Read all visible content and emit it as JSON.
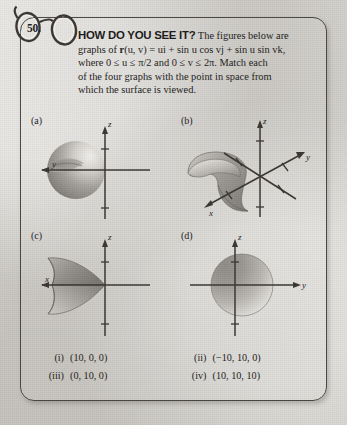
{
  "exercise": {
    "number": "50.",
    "icon": "eyeglasses-icon",
    "heading": "HOW DO YOU SEE IT?",
    "body_line1": "The figures below are",
    "body_line2_pre": "graphs of ",
    "body_line2_r": "r",
    "body_line2_args": "(u, v)",
    "body_line2_eq": " = ",
    "body_line2_terms": "ui + sin u cos vj + sin u sin vk,",
    "body_line3": "where 0 ≤ u ≤ π/2 and 0 ≤ v ≤ 2π. Match each",
    "body_line4": "of the four graphs with the point in space from",
    "body_line5": "which the surface is viewed."
  },
  "graphs": [
    {
      "key": "a",
      "label": "(a)",
      "axes": [
        "z",
        "y"
      ],
      "z_label": "z",
      "horizontal_label": "y",
      "view": "front-left",
      "description": "shaded sphere left of origin, y-axis arrow pointing left, z-axis vertical"
    },
    {
      "key": "b",
      "label": "(b)",
      "axes": [
        "z",
        "x",
        "y"
      ],
      "z_label": "z",
      "x_label": "x",
      "y_label": "y",
      "view": "isometric",
      "description": "three-dimensional oblique view with funnel shaped surface at left"
    },
    {
      "key": "c",
      "label": "(c)",
      "axes": [
        "z",
        "x"
      ],
      "z_label": "z",
      "horizontal_label": "x",
      "view": "side",
      "description": "pointed leaf shaped surface opening to the left, x-axis arrow pointing left"
    },
    {
      "key": "d",
      "label": "(d)",
      "axes": [
        "z",
        "y"
      ],
      "z_label": "z",
      "horizontal_label": "y",
      "view": "front",
      "description": "full circular disk centered at origin, y-axis arrow pointing right"
    }
  ],
  "answers": [
    {
      "roman": "(i)",
      "value": "(10, 0, 0)"
    },
    {
      "roman": "(ii)",
      "value": "(−10, 10, 0)"
    },
    {
      "roman": "(iii)",
      "value": "(0, 10, 0)"
    },
    {
      "roman": "(iv)",
      "value": "(10, 10, 10)"
    }
  ],
  "colors": {
    "paper": "#d6d4cf",
    "ink": "#232120",
    "border": "#4a4742",
    "axis": "#3a3733",
    "surface_dark": "#7d7a75",
    "surface_light": "#e6e4e0"
  }
}
